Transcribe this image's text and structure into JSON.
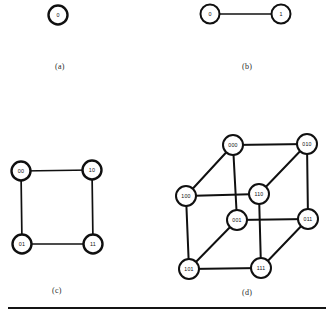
{
  "figure": {
    "panels": [
      {
        "id": "panel-a",
        "caption": "(a)",
        "caption_x": 55,
        "caption_y": 62,
        "node_radius": 9.5,
        "nodes": [
          {
            "label": "0",
            "x": 58,
            "y": 15
          }
        ],
        "edges": []
      },
      {
        "id": "panel-b",
        "caption": "(b)",
        "caption_x": 242,
        "caption_y": 62,
        "node_radius": 9.5,
        "nodes": [
          {
            "label": "0",
            "x": 210,
            "y": 14
          },
          {
            "label": "1",
            "x": 281,
            "y": 14
          }
        ],
        "edges": [
          {
            "from": "0",
            "to": "1"
          }
        ]
      },
      {
        "id": "panel-c",
        "caption": "(c)",
        "caption_x": 52,
        "caption_y": 286,
        "node_radius": 9.5,
        "nodes": [
          {
            "label": "00",
            "x": 21,
            "y": 171
          },
          {
            "label": "10",
            "x": 92,
            "y": 170
          },
          {
            "label": "01",
            "x": 22,
            "y": 244
          },
          {
            "label": "11",
            "x": 93,
            "y": 244
          }
        ],
        "edges": [
          {
            "from": "00",
            "to": "10"
          },
          {
            "from": "00",
            "to": "01"
          },
          {
            "from": "10",
            "to": "11"
          },
          {
            "from": "01",
            "to": "11"
          }
        ]
      },
      {
        "id": "panel-d",
        "caption": "(d)",
        "caption_x": 242,
        "caption_y": 288,
        "node_radius": 10,
        "nodes": [
          {
            "label": "000",
            "x": 233,
            "y": 145
          },
          {
            "label": "010",
            "x": 307,
            "y": 144
          },
          {
            "label": "100",
            "x": 186,
            "y": 196
          },
          {
            "label": "110",
            "x": 259,
            "y": 194
          },
          {
            "label": "001",
            "x": 237,
            "y": 220
          },
          {
            "label": "011",
            "x": 308,
            "y": 219
          },
          {
            "label": "101",
            "x": 189,
            "y": 269
          },
          {
            "label": "111",
            "x": 261,
            "y": 268
          }
        ],
        "edges": [
          {
            "from": "000",
            "to": "010"
          },
          {
            "from": "000",
            "to": "100"
          },
          {
            "from": "000",
            "to": "001"
          },
          {
            "from": "010",
            "to": "110"
          },
          {
            "from": "010",
            "to": "011"
          },
          {
            "from": "100",
            "to": "110"
          },
          {
            "from": "100",
            "to": "101"
          },
          {
            "from": "110",
            "to": "111"
          },
          {
            "from": "001",
            "to": "011"
          },
          {
            "from": "001",
            "to": "101"
          },
          {
            "from": "011",
            "to": "111"
          },
          {
            "from": "101",
            "to": "111"
          }
        ]
      }
    ],
    "rule": {
      "x": 8,
      "y": 307,
      "width": 318
    }
  }
}
